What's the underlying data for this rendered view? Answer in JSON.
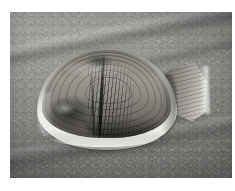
{
  "page": {
    "type": "photograph",
    "width": 235,
    "height": 191,
    "border_color": "#ffffff",
    "caption": ""
  },
  "photo": {
    "subject": "clam shell on sand",
    "alt_text": "A weathered clam shell lying on rippled beach sand with a smaller broken shell fragment beside it",
    "tone": "desaturated grayscale",
    "frame": {
      "left": 10,
      "top": 12,
      "width": 222,
      "height": 166
    }
  },
  "colors": {
    "sand_light": "#9a9a96",
    "sand_mid": "#8d8d8a",
    "sand_dark": "#7c7c79",
    "shell_rim_white": "#f7f6f2",
    "shell_body_mid": "#9b9890",
    "shell_body_dark": "#4a4843",
    "fragment_light": "#d9d6cf",
    "shadow": "rgba(0,0,0,0.34)"
  },
  "elements": {
    "background_label": "beach-sand",
    "main_shell_label": "clam-shell",
    "fragment_label": "shell-fragment",
    "shadow_label": "cast-shadow",
    "ridge_label": "sand-ridge"
  }
}
